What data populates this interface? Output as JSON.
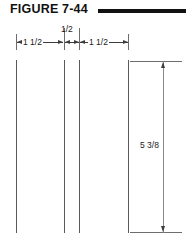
{
  "header": {
    "title": "FIGURE 7-44",
    "rule_color": "#111111"
  },
  "drawing": {
    "line_color": "#5a5a5a",
    "dimension_color": "#3d3d3d",
    "horizontal_dimensions": [
      {
        "label": "1 1/2",
        "position": "left"
      },
      {
        "label": "1/2",
        "position": "center-top"
      },
      {
        "label": "1 1/2",
        "position": "right"
      }
    ],
    "vertical_dimension": {
      "label": "5 3/8"
    }
  },
  "icons": {
    "arrow_left": "arrow-left-icon",
    "arrow_right": "arrow-right-icon",
    "arrow_up": "arrow-up-icon",
    "arrow_down": "arrow-down-icon"
  }
}
